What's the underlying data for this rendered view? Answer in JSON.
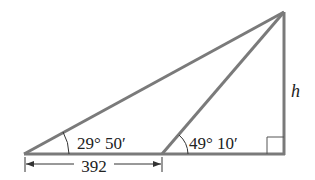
{
  "diagram": {
    "type": "right-triangle-height-problem",
    "colors": {
      "stroke": "#7a7a7a",
      "text": "#222222",
      "background": "#ffffff"
    },
    "labels": {
      "angle_left": "29° 50′",
      "angle_middle": "49° 10′",
      "height": "h",
      "base_distance": "392"
    },
    "points": {
      "left_vertex": [
        24,
        154
      ],
      "middle_point": [
        162,
        154
      ],
      "right_corner": [
        284,
        154
      ],
      "apex": [
        284,
        12
      ]
    }
  }
}
